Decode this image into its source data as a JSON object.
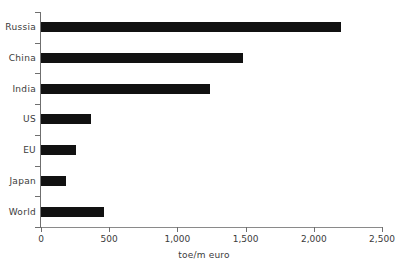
{
  "chart_data": {
    "type": "bar",
    "orientation": "horizontal",
    "title": "",
    "subtitle": "",
    "xlabel": "toe/m euro",
    "ylabel": "",
    "categories": [
      "Russia",
      "China",
      "India",
      "US",
      "EU",
      "Japan",
      "World"
    ],
    "values": [
      2200,
      1480,
      1240,
      370,
      260,
      185,
      460
    ],
    "series": [
      {
        "name": "Energy intensity",
        "values": [
          2200,
          1480,
          1240,
          370,
          260,
          185,
          460
        ]
      }
    ],
    "xlim": [
      0,
      2500
    ],
    "xticks": [
      0,
      500,
      1000,
      1500,
      2000,
      2500
    ],
    "xtick_labels": [
      "0",
      "500",
      "1,000",
      "1,500",
      "2,000",
      "2,500"
    ],
    "grid": false,
    "legend": false,
    "legend_position": "none",
    "bar_color": "#111111",
    "axis_color": "#6f6f6f",
    "text_color": "#3b3b3b",
    "background_color": "#ffffff"
  }
}
